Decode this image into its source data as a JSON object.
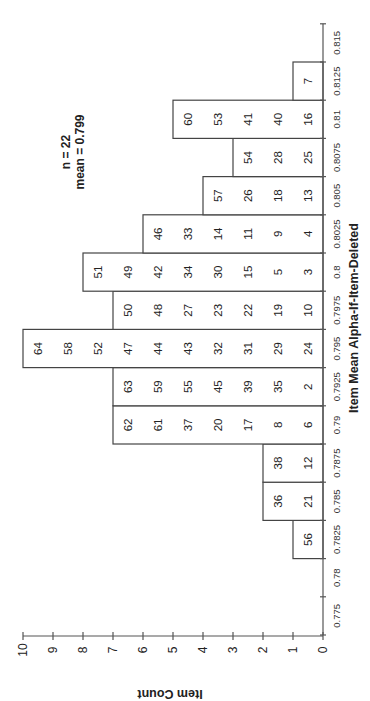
{
  "chart_data": {
    "type": "bar",
    "orientation": "rotated-90-clockwise (page layout: category axis vertical on right, count axis horizontal on bottom)",
    "title": "",
    "xlabel": "Item Mean Alpha-If-Item-Deleted",
    "ylabel": "Item Count",
    "categories": [
      "0.775",
      "0.78",
      "0.7825",
      "0.785",
      "0.7875",
      "0.79",
      "0.7925",
      "0.795",
      "0.7975",
      "0.8",
      "0.8025",
      "0.805",
      "0.8075",
      "0.81",
      "0.8125",
      "0.815"
    ],
    "values": [
      0,
      0,
      1,
      2,
      2,
      7,
      7,
      10,
      7,
      8,
      6,
      4,
      3,
      5,
      1,
      0
    ],
    "stacked_item_labels": [
      [],
      [],
      [
        "56"
      ],
      [
        "21",
        "36"
      ],
      [
        "12",
        "38"
      ],
      [
        "6",
        "8",
        "17",
        "20",
        "37",
        "61",
        "62"
      ],
      [
        "2",
        "35",
        "39",
        "45",
        "55",
        "59",
        "63"
      ],
      [
        "24",
        "29",
        "31",
        "32",
        "43",
        "44",
        "47",
        "52",
        "58",
        "64"
      ],
      [
        "10",
        "19",
        "22",
        "23",
        "27",
        "48",
        "50"
      ],
      [
        "3",
        "5",
        "15",
        "30",
        "34",
        "42",
        "49",
        "51"
      ],
      [
        "4",
        "9",
        "11",
        "14",
        "33",
        "46"
      ],
      [
        "13",
        "18",
        "26",
        "57"
      ],
      [
        "25",
        "28",
        "54"
      ],
      [
        "16",
        "40",
        "41",
        "53",
        "60"
      ],
      [
        "7"
      ],
      []
    ],
    "ylim": [
      0,
      10
    ],
    "yticks": [
      "0",
      "1",
      "2",
      "3",
      "4",
      "5",
      "6",
      "7",
      "8",
      "9",
      "10"
    ],
    "grid": false,
    "legend": null,
    "annotations": [
      "n = 22",
      "mean = 0.799"
    ]
  },
  "annotation": {
    "line1": "n = 22",
    "line2": "mean = 0.799"
  },
  "axes": {
    "x_title": "Item Mean Alpha-If-Item-Deleted",
    "y_title": "Item Count"
  }
}
